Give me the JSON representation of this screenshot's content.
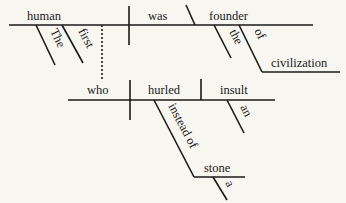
{
  "diagram": {
    "type": "sentence-diagram",
    "main_clause": {
      "subject": "human",
      "subject_modifiers": [
        "The",
        "first"
      ],
      "verb": "was",
      "predicate_nominative": "founder",
      "predicate_modifiers": [
        "the"
      ],
      "prepositional_phrase": {
        "preposition": "of",
        "object": "civilization"
      }
    },
    "relative_clause": {
      "subject": "who",
      "verb": "hurled",
      "object": "insult",
      "object_modifiers": [
        "an"
      ],
      "prepositional_phrase": {
        "preposition": "instead of",
        "object": "stone",
        "object_modifiers": [
          "a"
        ]
      }
    }
  },
  "colors": {
    "ink": "#1a1a1a",
    "background": "#f7f6f1"
  }
}
